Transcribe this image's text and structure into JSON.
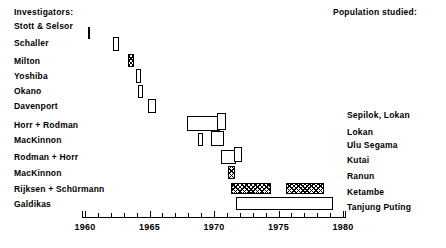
{
  "header": {
    "investigators_label": "Investigators:",
    "population_label": "Population studied:"
  },
  "chart_data": {
    "type": "bar",
    "orientation": "horizontal",
    "title": "",
    "subtitle": "",
    "xlabel": "",
    "ylabel": "",
    "xlim": [
      1959.6,
      1980.2
    ],
    "grid": false,
    "legend": null,
    "axis": {
      "major_ticks": [
        1960,
        1965,
        1970,
        1975,
        1980
      ],
      "major_tick_labels": [
        "1960",
        "1965",
        "1970",
        "1975",
        "1980"
      ],
      "minor_tick_step": 1,
      "tick_start": 1959.75,
      "tick_end": 1980.0
    },
    "categories": [
      "Stott & Selsor",
      "Schaller",
      "Milton",
      "Yoshiba",
      "Okano",
      "Davenport",
      "Horr + Rodman",
      "MacKinnon",
      "Rodman + Horr",
      "MacKinnon",
      "Rijksen + Schürmann",
      "Galdikas"
    ],
    "populations": [
      "",
      "",
      "",
      "",
      "",
      "",
      "Sepilok, Lokan",
      "Lokan",
      "Ulu Segama",
      "Kutai",
      "Ranun",
      "Ketambe",
      "Tanjung Puting"
    ],
    "rows": [
      {
        "investigator": "Stott & Selsor",
        "population": "",
        "intervals": [
          {
            "start": 1960.2,
            "end": 1960.35,
            "fill": "solid"
          }
        ]
      },
      {
        "investigator": "Schaller",
        "population": "",
        "intervals": [
          {
            "start": 1962.2,
            "end": 1962.7,
            "fill": "open"
          }
        ]
      },
      {
        "investigator": "Milton",
        "population": "",
        "intervals": [
          {
            "start": 1963.35,
            "end": 1963.75,
            "fill": "hatched"
          }
        ]
      },
      {
        "investigator": "Yoshiba",
        "population": "",
        "intervals": [
          {
            "start": 1963.95,
            "end": 1964.35,
            "fill": "open"
          }
        ]
      },
      {
        "investigator": "Okano",
        "population": "",
        "intervals": [
          {
            "start": 1964.1,
            "end": 1964.45,
            "fill": "open"
          }
        ]
      },
      {
        "investigator": "Davenport",
        "population": "",
        "intervals": [
          {
            "start": 1964.9,
            "end": 1965.5,
            "fill": "open"
          }
        ]
      },
      {
        "investigator": "Horr + Rodman",
        "population": "Sepilok, Lokan",
        "intervals": [
          {
            "start": 1967.9,
            "end": 1970.4,
            "fill": "open"
          },
          {
            "start": 1970.3,
            "end": 1970.9,
            "fill": "open"
          }
        ]
      },
      {
        "investigator": "MacKinnon",
        "population": "Lokan",
        "intervals": [
          {
            "start": 1968.75,
            "end": 1969.1,
            "fill": "open"
          },
          {
            "start": 1969.85,
            "end": 1970.75,
            "fill": "open"
          }
        ]
      },
      {
        "investigator": "Rodman + Horr",
        "population": "Ulu Segama",
        "intervals": [
          {
            "start": 1970.5,
            "end": 1971.65,
            "fill": "open"
          },
          {
            "start": 1971.5,
            "end": 1972.1,
            "fill": "open"
          }
        ]
      },
      {
        "investigator": "MacKinnon",
        "population": "Kutai",
        "intervals": [
          {
            "start": 1971.1,
            "end": 1971.55,
            "fill": "hatched"
          }
        ]
      },
      {
        "investigator": "Rijksen + Schürmann",
        "population": "Ranun",
        "intervals": [
          {
            "start": 1971.3,
            "end": 1974.4,
            "fill": "hatched"
          },
          {
            "start": 1975.5,
            "end": 1978.5,
            "fill": "hatched"
          }
        ]
      },
      {
        "investigator": "Galdikas",
        "population": "Ketambe",
        "intervals": [
          {
            "start": 1971.7,
            "end": 1979.2,
            "fill": "open"
          }
        ]
      }
    ],
    "population_rows": [
      {
        "label": "Sepilok, Lokan"
      },
      {
        "label": "Lokan"
      },
      {
        "label": "Ulu Segama"
      },
      {
        "label": "Kutai"
      },
      {
        "label": "Ranun"
      },
      {
        "label": "Ketambe"
      },
      {
        "label": "Tanjung Puting"
      }
    ]
  },
  "layout": {
    "left_labels": [
      {
        "text": "Stott & Selsor",
        "top": 21
      },
      {
        "text": "Schaller",
        "top": 38
      },
      {
        "text": "Milton",
        "top": 56
      },
      {
        "text": "Yoshiba",
        "top": 71
      },
      {
        "text": "Okano",
        "top": 86
      },
      {
        "text": "Davenport",
        "top": 101
      },
      {
        "text": "Horr + Rodman",
        "top": 120
      },
      {
        "text": "MacKinnon",
        "top": 135
      },
      {
        "text": "Rodman + Horr",
        "top": 152
      },
      {
        "text": "MacKinnon",
        "top": 168
      },
      {
        "text": "Rijksen + Schürmann",
        "top": 184
      },
      {
        "text": "Galdikas",
        "top": 199
      }
    ],
    "right_labels": [
      {
        "text": "Sepilok, Lokan",
        "top": 110
      },
      {
        "text": "Lokan",
        "top": 127
      },
      {
        "text": "Ulu Segama",
        "top": 140
      },
      {
        "text": "Kutai",
        "top": 155
      },
      {
        "text": "Ranun",
        "top": 171
      },
      {
        "text": "Ketambe",
        "top": 187
      },
      {
        "text": "Tanjung Puting",
        "top": 202
      }
    ],
    "bars": [
      {
        "name": "bar-stott-selsor-1",
        "left": 88,
        "top": 27,
        "width": 2,
        "height": 12,
        "fill": "solid"
      },
      {
        "name": "bar-schaller-1",
        "left": 113,
        "top": 37,
        "width": 6,
        "height": 14,
        "fill": "open"
      },
      {
        "name": "bar-milton-1",
        "left": 128,
        "top": 54,
        "width": 6,
        "height": 13,
        "fill": "hatched"
      },
      {
        "name": "bar-yoshiba-1",
        "left": 136,
        "top": 69,
        "width": 5,
        "height": 14,
        "fill": "open"
      },
      {
        "name": "bar-okano-1",
        "left": 138,
        "top": 85,
        "width": 5,
        "height": 13,
        "fill": "open"
      },
      {
        "name": "bar-davenport-1",
        "left": 148,
        "top": 99,
        "width": 8,
        "height": 14,
        "fill": "open"
      },
      {
        "name": "bar-horr-rodman-1",
        "left": 187,
        "top": 116,
        "width": 33,
        "height": 15,
        "fill": "open"
      },
      {
        "name": "bar-horr-rodman-2",
        "left": 217,
        "top": 113,
        "width": 9,
        "height": 17,
        "fill": "open"
      },
      {
        "name": "bar-mackinnon-1a",
        "left": 198,
        "top": 133,
        "width": 5,
        "height": 13,
        "fill": "open"
      },
      {
        "name": "bar-mackinnon-1b",
        "left": 211,
        "top": 131,
        "width": 13,
        "height": 15,
        "fill": "open"
      },
      {
        "name": "bar-rodman-horr-1",
        "left": 221,
        "top": 150,
        "width": 15,
        "height": 14,
        "fill": "open"
      },
      {
        "name": "bar-rodman-horr-2",
        "left": 234,
        "top": 147,
        "width": 8,
        "height": 15,
        "fill": "open"
      },
      {
        "name": "bar-mackinnon-2",
        "left": 228,
        "top": 166,
        "width": 7,
        "height": 13,
        "fill": "hatched"
      },
      {
        "name": "bar-rijksen-1",
        "left": 231,
        "top": 183,
        "width": 40,
        "height": 11,
        "fill": "hatched"
      },
      {
        "name": "bar-rijksen-2",
        "left": 286,
        "top": 183,
        "width": 38,
        "height": 11,
        "fill": "hatched"
      },
      {
        "name": "bar-galdikas-1",
        "left": 236,
        "top": 197,
        "width": 97,
        "height": 13,
        "fill": "open"
      }
    ]
  }
}
